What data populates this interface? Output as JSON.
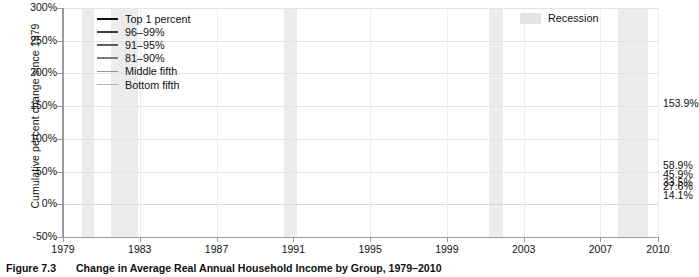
{
  "figure": {
    "number": "Figure 7.3",
    "caption": "Change in Average Real Annual Household Income by Group, 1979–2010"
  },
  "axes": {
    "ylabel": "Cumulative percent change since 1979",
    "yticks": [
      "300%",
      "250%",
      "200%",
      "150%",
      "100%",
      "50%",
      "0%",
      "-50%"
    ],
    "xticks": [
      "1979",
      "1983",
      "1987",
      "1991",
      "1995",
      "1999",
      "2003",
      "2007",
      "2010"
    ]
  },
  "legend": {
    "items": [
      {
        "label": "Top 1 percent",
        "color": "#111111",
        "width": 2.6
      },
      {
        "label": "96–99%",
        "color": "#3d3d3d",
        "width": 2.2
      },
      {
        "label": "91–95%",
        "color": "#5e5e5e",
        "width": 2.0
      },
      {
        "label": "81–90%",
        "color": "#7d7d7d",
        "width": 2.0
      },
      {
        "label": "Middle fifth",
        "color": "#979797",
        "width": 1.9
      },
      {
        "label": "Bottom fifth",
        "color": "#b3b3b3",
        "width": 1.9
      }
    ],
    "recession_label": "Recession",
    "recession_color": "#e4e4e4"
  },
  "end_labels": [
    {
      "text": "153.9%",
      "series": "Top 1 percent"
    },
    {
      "text": "58.9%",
      "series": "96–99%"
    },
    {
      "text": "45.9%",
      "series": "91–95%"
    },
    {
      "text": "33.5%",
      "series": "81–90%"
    },
    {
      "text": "27.6%",
      "series": "Middle fifth"
    },
    {
      "text": "14.1%",
      "series": "Bottom fifth"
    }
  ],
  "chart_data": {
    "type": "line",
    "title": "Change in Average Real Annual Household Income by Group, 1979–2010",
    "xlabel": "",
    "ylabel": "Cumulative percent change since 1979",
    "ylim": [
      -50,
      300
    ],
    "xlim": [
      1979,
      2010
    ],
    "ytick_values": [
      -50,
      0,
      50,
      100,
      150,
      200,
      250,
      300
    ],
    "xtick_values": [
      1979,
      1983,
      1987,
      1991,
      1995,
      1999,
      2003,
      2007,
      2010
    ],
    "grid": true,
    "legend_position": "top-left",
    "x": [
      1979,
      1980,
      1981,
      1982,
      1983,
      1984,
      1985,
      1986,
      1987,
      1988,
      1989,
      1990,
      1991,
      1992,
      1993,
      1994,
      1995,
      1996,
      1997,
      1998,
      1999,
      2000,
      2001,
      2002,
      2003,
      2004,
      2005,
      2006,
      2007,
      2008,
      2009,
      2010
    ],
    "series": [
      {
        "name": "Top 1 percent",
        "color": "#111111",
        "end_value": 153.9,
        "values": [
          0,
          -3,
          -2,
          2,
          8,
          21,
          28,
          64,
          38,
          59,
          54,
          47,
          38,
          48,
          44,
          41,
          48,
          62,
          80,
          101,
          124,
          180,
          141,
          101,
          113,
          139,
          176,
          206,
          240,
          190,
          150,
          153.9
        ]
      },
      {
        "name": "96–99%",
        "color": "#3d3d3d",
        "end_value": 58.9,
        "values": [
          0,
          -2,
          -2,
          0,
          3,
          7,
          10,
          16,
          16,
          19,
          21,
          20,
          17,
          18,
          18,
          19,
          23,
          27,
          31,
          37,
          42,
          48,
          45,
          41,
          41,
          45,
          50,
          57,
          60,
          56,
          56,
          58.9
        ]
      },
      {
        "name": "91–95%",
        "color": "#5e5e5e",
        "end_value": 45.9,
        "values": [
          0,
          -2,
          -2,
          -1,
          1,
          4,
          6,
          10,
          11,
          13,
          15,
          14,
          11,
          12,
          12,
          13,
          16,
          19,
          23,
          28,
          32,
          37,
          35,
          32,
          32,
          34,
          38,
          43,
          47,
          45,
          45,
          45.9
        ]
      },
      {
        "name": "81–90%",
        "color": "#7d7d7d",
        "end_value": 33.5,
        "values": [
          0,
          -2,
          -3,
          -3,
          -1,
          2,
          4,
          7,
          8,
          10,
          11,
          10,
          7,
          8,
          8,
          9,
          11,
          14,
          18,
          22,
          26,
          29,
          28,
          25,
          25,
          26,
          29,
          33,
          36,
          34,
          33,
          33.5
        ]
      },
      {
        "name": "Middle fifth",
        "color": "#979797",
        "end_value": 27.6,
        "values": [
          0,
          -3,
          -4,
          -5,
          -4,
          -1,
          1,
          4,
          5,
          7,
          8,
          6,
          3,
          3,
          3,
          4,
          6,
          9,
          12,
          16,
          19,
          22,
          21,
          19,
          19,
          19,
          21,
          24,
          27,
          24,
          24,
          27.6
        ]
      },
      {
        "name": "Bottom fifth",
        "color": "#b3b3b3",
        "end_value": 14.1,
        "values": [
          0,
          -4,
          -6,
          -8,
          -8,
          -6,
          -5,
          -2,
          -2,
          -1,
          0,
          -2,
          -4,
          -4,
          -5,
          -4,
          -2,
          0,
          3,
          7,
          10,
          13,
          12,
          10,
          9,
          9,
          10,
          12,
          14,
          12,
          12,
          14.1
        ]
      }
    ],
    "recession_bands": [
      {
        "start": 1980.0,
        "end": 1980.6
      },
      {
        "start": 1981.5,
        "end": 1982.9
      },
      {
        "start": 1990.5,
        "end": 1991.2
      },
      {
        "start": 2001.2,
        "end": 2001.9
      },
      {
        "start": 2007.9,
        "end": 2009.5
      }
    ]
  }
}
